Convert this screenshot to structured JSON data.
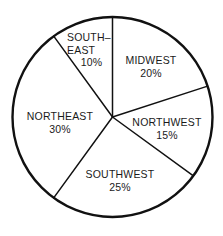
{
  "chart_data": {
    "type": "pie",
    "title": "",
    "subtitle": "",
    "xlabel": "",
    "ylabel": "",
    "grid": false,
    "legend": "none",
    "labels_inside_slices": true,
    "start_angle_deg": 0,
    "direction": "clockwise",
    "categories": [
      "MIDWEST",
      "NORTHWEST",
      "SOUTHWEST",
      "NORTHEAST",
      "SOUTHEAST"
    ],
    "values": [
      20,
      15,
      25,
      30,
      10
    ],
    "value_unit": "%",
    "slices": [
      {
        "name": "MIDWEST",
        "display_name": "MIDWEST",
        "name_line1": "MIDWEST",
        "name_line2": "",
        "value": 20,
        "value_label": "20%",
        "start_deg": 0,
        "end_deg": 72,
        "fill": "#ffffff"
      },
      {
        "name": "NORTHWEST",
        "display_name": "NORTHWEST",
        "name_line1": "NORTHWEST",
        "name_line2": "",
        "value": 15,
        "value_label": "15%",
        "start_deg": 72,
        "end_deg": 126,
        "fill": "#ffffff"
      },
      {
        "name": "SOUTHWEST",
        "display_name": "SOUTHWEST",
        "name_line1": "SOUTHWEST",
        "name_line2": "",
        "value": 25,
        "value_label": "25%",
        "start_deg": 126,
        "end_deg": 216,
        "fill": "#ffffff"
      },
      {
        "name": "NORTHEAST",
        "display_name": "NORTHEAST",
        "name_line1": "NORTHEAST",
        "name_line2": "",
        "value": 30,
        "value_label": "30%",
        "start_deg": 216,
        "end_deg": 324,
        "fill": "#ffffff"
      },
      {
        "name": "SOUTHEAST",
        "display_name": "SOUTH-EAST",
        "name_line1": "SOUTH–",
        "name_line2": "EAST",
        "value": 10,
        "value_label": "10%",
        "start_deg": 324,
        "end_deg": 360,
        "fill": "#ffffff"
      }
    ],
    "total": 100,
    "colors": {
      "outline": "#111111",
      "divider": "#111111",
      "slice_fill": "#ffffff",
      "text": "#1a1a1a",
      "background": "#ffffff"
    },
    "geometry": {
      "center_x": 112.5,
      "center_y": 117,
      "radius": 100,
      "outline_width": 2.4,
      "divider_width": 1.5
    }
  }
}
